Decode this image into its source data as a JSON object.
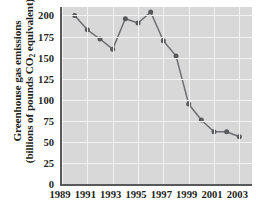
{
  "chart_data": {
    "type": "line",
    "title": "",
    "xlabel": "",
    "ylabel_line1": "Greenhouse gas emissions",
    "ylabel_line2_pre": "(billions of pounds CO",
    "ylabel_line2_sub": "2",
    "ylabel_line2_post": " equivalent)",
    "x": [
      1990,
      1991,
      1992,
      1993,
      1994,
      1995,
      1996,
      1997,
      1998,
      1999,
      2000,
      2001,
      2002,
      2003
    ],
    "values": [
      200,
      183,
      172,
      160,
      196,
      191,
      204,
      170,
      152,
      95,
      76,
      62,
      62,
      56
    ],
    "series": [
      {
        "name": "Greenhouse gas emissions",
        "values": [
          200,
          183,
          172,
          160,
          196,
          191,
          204,
          170,
          152,
          95,
          76,
          62,
          62,
          56
        ]
      }
    ],
    "xlim": [
      1989,
      2004
    ],
    "ylim": [
      0,
      210
    ],
    "xticks": [
      1989,
      1991,
      1993,
      1995,
      1997,
      1999,
      2001,
      2003
    ],
    "xticklabels": [
      "1989",
      "1991",
      "1993",
      "1995",
      "1997",
      "1999",
      "2001",
      "2003"
    ],
    "yticks": [
      0,
      25,
      50,
      75,
      100,
      125,
      150,
      175,
      200
    ],
    "yticklabels": [
      "0",
      "25",
      "50",
      "75",
      "100",
      "125",
      "150",
      "175",
      "200"
    ],
    "grid": true,
    "grid_color": "#f2f2f2",
    "plot_background": "#d8d8d8",
    "line_color": "#6d6e71",
    "marker_color": "#58595b",
    "marker": "circle",
    "legend": false
  }
}
